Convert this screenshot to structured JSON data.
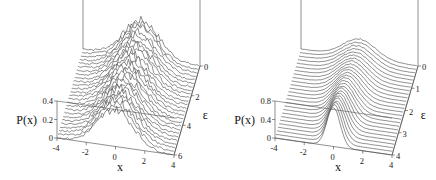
{
  "chart_data": [
    {
      "type": "waterfall-3d",
      "title": "",
      "xlabel": "x",
      "ylabel": "P(x)",
      "zlabel": "ε",
      "x_ticks": [
        "-4",
        "-2",
        "0",
        "2",
        "4"
      ],
      "y_ticks": [
        "0",
        "0.2",
        "0.4"
      ],
      "z_ticks": [
        "0",
        "2",
        "4",
        "6"
      ],
      "xlim": [
        -4,
        4
      ],
      "ylim": [
        0,
        0.4
      ],
      "zlim": [
        0,
        6
      ],
      "n_curves": 26,
      "description": "Noisy Gaussian-like distributions P(x) centered at x≈0, peak ≈0.4, width ~1.2, one curve per ε from 0 to 6",
      "peak": 0.4,
      "width": 1.2,
      "noise": 0.035
    },
    {
      "type": "waterfall-3d",
      "title": "",
      "xlabel": "x",
      "ylabel": "P(x)",
      "zlabel": "ε",
      "x_ticks": [
        "-4",
        "-2",
        "0",
        "2",
        "4"
      ],
      "y_ticks": [
        "0",
        "0.4",
        "0.8"
      ],
      "z_ticks": [
        "0",
        "1",
        "2",
        "3",
        "4"
      ],
      "xlim": [
        -4,
        4
      ],
      "ylim": [
        0,
        0.8
      ],
      "zlim": [
        0,
        4
      ],
      "n_curves": 26,
      "description": "Distributions P(x) centered at x≈0; narrow tall peak (≈0.8+) at large ε, broadening to ≈0.4 at ε=0",
      "peak_front": 0.85,
      "peak_back": 0.4,
      "width_front": 0.45,
      "width_back": 1.1,
      "noise": 0.01
    }
  ]
}
